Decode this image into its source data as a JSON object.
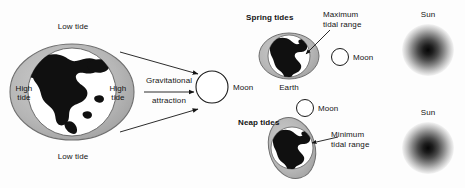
{
  "figure": {
    "title_visible": false,
    "background_color": "#fdfdfd",
    "ink_color": "#141414"
  },
  "panels": {
    "left": {
      "name": "earth-moon-gravitational-attraction",
      "labels": {
        "low_tide_top": "Low tide",
        "low_tide_bottom": "Low tide",
        "high_tide_left_line1": "High",
        "high_tide_left_line2": "tide",
        "high_tide_right_line1": "High",
        "high_tide_right_line2": "tide",
        "gravitational_line1": "Gravitational",
        "gravitational_line2": "attraction",
        "moon": "Moon"
      },
      "colors": {
        "bulge_fill": "#b9b9b9",
        "bulge_stroke": "#6f6f6f",
        "globe_fill": "#ffffff",
        "globe_stroke": "#5a5a5a",
        "land_fill": "#101010",
        "moon_fill": "#ffffff",
        "moon_stroke": "#1a1a1a"
      }
    },
    "spring": {
      "name": "spring-tides",
      "labels": {
        "title": "Spring tides",
        "max_range_line1": "Maximum",
        "max_range_line2": "tidal range",
        "earth": "Earth",
        "moon": "Moon",
        "sun": "Sun"
      },
      "colors": {
        "bulge_fill": "#b9b9b9",
        "bulge_stroke": "#6f6f6f",
        "globe_fill": "#ffffff",
        "land_fill": "#101010",
        "sun_core": "#0d0d0d",
        "sun_edge": "#ffffff"
      }
    },
    "neap": {
      "name": "neap-tides",
      "labels": {
        "title": "Neap tides",
        "min_range_line1": "Minimum",
        "min_range_line2": "tidal range",
        "moon": "Moon",
        "sun": "Sun"
      },
      "colors": {
        "bulge_fill": "#b9b9b9",
        "bulge_stroke": "#6f6f6f",
        "globe_fill": "#ffffff",
        "land_fill": "#101010",
        "sun_core": "#0d0d0d",
        "sun_edge": "#ffffff"
      }
    }
  }
}
